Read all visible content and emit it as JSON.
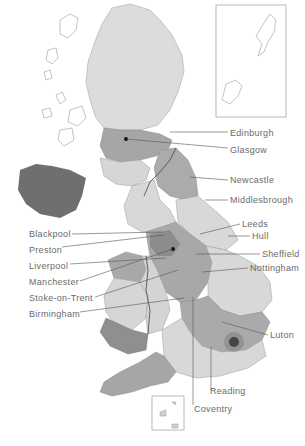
{
  "map": {
    "title": "",
    "colors": {
      "light": "#d9d9d9",
      "medium": "#b0b0b0",
      "dark": "#8a8a8a",
      "darkest": "#6e6e6e",
      "outline": "#9a9a9a",
      "leader": "#555555",
      "text": "#6a6a6a"
    },
    "labels": {
      "edinburgh": "Edinburgh",
      "glasgow": "Glasgow",
      "newcastle": "Newcastle",
      "middlesbrough": "Middlesbrough",
      "leeds": "Leeds",
      "hull": "Hull",
      "sheffield": "Sheffield",
      "nottingham": "Nottingham",
      "blackpool": "Blackpool",
      "preston": "Preston",
      "liverpool": "Liverpool",
      "manchester": "Manchester",
      "stoke": "Stoke-on-Trent",
      "birmingham": "Birmingham",
      "luton": "Luton",
      "reading": "Reading",
      "coventry": "Coventry"
    },
    "insets": [
      "shetland-orkney-inset",
      "channel-islands-inset"
    ]
  }
}
